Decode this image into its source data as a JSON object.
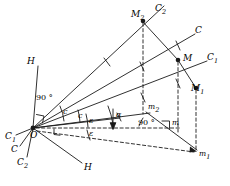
{
  "figure": {
    "stroke_color": "#1a1a1a",
    "background_color": "#ffffff"
  },
  "points": {
    "O": {
      "label": "O",
      "x": 33,
      "y": 128
    },
    "M": {
      "label": "M",
      "x": 178,
      "y": 57
    },
    "M1": {
      "label": "M",
      "sub": "1",
      "x": 196,
      "y": 85
    },
    "M2": {
      "label": "M",
      "sub": "2",
      "x": 143,
      "y": 17
    },
    "m": {
      "label": "m",
      "x": 172,
      "y": 122
    },
    "m1": {
      "label": "m",
      "sub": "1",
      "x": 197,
      "y": 155
    },
    "m2": {
      "label": "m",
      "sub": "2",
      "x": 153,
      "y": 107
    }
  },
  "ray_labels": [
    {
      "name": "C-upper-right",
      "text": "C",
      "sub": "",
      "x": 197,
      "y": 31
    },
    {
      "name": "C1-upper-right",
      "text": "C",
      "sub": "1",
      "x": 209,
      "y": 58
    },
    {
      "name": "C2-top",
      "text": "C",
      "sub": "2",
      "x": 157,
      "y": 10
    },
    {
      "name": "H-upper-left",
      "text": "H",
      "sub": "",
      "x": 29,
      "y": 62
    },
    {
      "name": "H-lower-right",
      "text": "H",
      "sub": "",
      "x": 86,
      "y": 168
    },
    {
      "name": "C1-lower-left",
      "text": "C",
      "sub": "1",
      "x": 9,
      "y": 137
    },
    {
      "name": "C-lower-left",
      "text": "C",
      "sub": "",
      "x": 14,
      "y": 150
    },
    {
      "name": "C2-lower-left",
      "text": "C",
      "sub": "2",
      "x": 20,
      "y": 163
    }
  ],
  "angle_labels": [
    {
      "name": "right-angle-at-O",
      "text": "90 °",
      "x": 40,
      "y": 97
    },
    {
      "name": "right-angle-at-m",
      "text": "90 °",
      "x": 143,
      "y": 122
    },
    {
      "name": "epsilon-upper",
      "text": "ε",
      "x": 92,
      "y": 121
    },
    {
      "name": "epsilon-lower",
      "text": "ε",
      "x": 92,
      "y": 134
    },
    {
      "name": "alpha",
      "text": "α",
      "x": 119,
      "y": 116
    },
    {
      "name": "c-arc-outer",
      "text": "c",
      "x": 66,
      "y": 112
    },
    {
      "name": "c-arc-inner",
      "text": "c",
      "x": 81,
      "y": 116
    }
  ],
  "segments": {
    "solid": [
      {
        "name": "ray-O-to-C2-top",
        "x1": 33,
        "y1": 128,
        "x2": 164,
        "y2": 5
      },
      {
        "name": "ray-O-to-C",
        "x1": 33,
        "y1": 128,
        "x2": 195,
        "y2": 34
      },
      {
        "name": "ray-O-to-C1",
        "x1": 33,
        "y1": 128,
        "x2": 207,
        "y2": 61
      },
      {
        "name": "ray-O-to-H-upper",
        "x1": 33,
        "y1": 128,
        "x2": 38,
        "y2": 66
      },
      {
        "name": "ray-O-to-H-lower",
        "x1": 33,
        "y1": 128,
        "x2": 82,
        "y2": 162
      },
      {
        "name": "ray-O-to-C1-lower",
        "x1": 33,
        "y1": 128,
        "x2": 17,
        "y2": 136
      },
      {
        "name": "ray-O-to-C-lower",
        "x1": 33,
        "y1": 128,
        "x2": 21,
        "y2": 147
      },
      {
        "name": "ray-O-to-C2-lower",
        "x1": 33,
        "y1": 128,
        "x2": 28,
        "y2": 158
      },
      {
        "name": "edge-M2-to-M",
        "x1": 143,
        "y1": 22,
        "x2": 178,
        "y2": 61
      },
      {
        "name": "edge-M-to-M1",
        "x1": 178,
        "y1": 61,
        "x2": 196,
        "y2": 89
      },
      {
        "name": "edge-m2-to-m1",
        "x1": 146,
        "y1": 113,
        "x2": 197,
        "y2": 150
      }
    ],
    "dashed": [
      {
        "name": "drop-M2-to-base",
        "x1": 143,
        "y1": 22,
        "x2": 143,
        "y2": 113
      },
      {
        "name": "drop-M-to-m",
        "x1": 178,
        "y1": 61,
        "x2": 178,
        "y2": 130
      },
      {
        "name": "drop-M1-to-m1",
        "x1": 196,
        "y1": 89,
        "x2": 196,
        "y2": 150
      },
      {
        "name": "baseline-O-to-m",
        "x1": 33,
        "y1": 128,
        "x2": 180,
        "y2": 128
      },
      {
        "name": "base-O-to-m1",
        "x1": 33,
        "y1": 131,
        "x2": 195,
        "y2": 152
      }
    ]
  },
  "markers": {
    "tick_marks": "perpendicular hatch ticks on rays",
    "right_angle_squares": 3,
    "arrow_alpha": "downward arrow at alpha"
  }
}
